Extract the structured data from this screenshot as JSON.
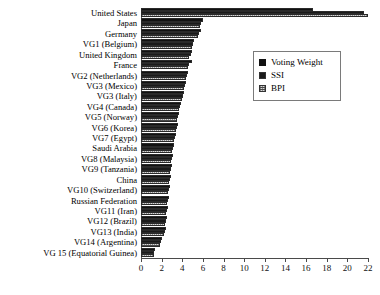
{
  "chart_data": {
    "type": "bar",
    "orientation": "horizontal",
    "title": "",
    "xlabel": "",
    "ylabel": "",
    "xlim": [
      0,
      22
    ],
    "xticks": [
      0,
      2,
      4,
      6,
      8,
      10,
      12,
      14,
      16,
      18,
      20,
      22
    ],
    "grid": false,
    "legend_position": "upper-right",
    "categories": [
      "United States",
      "Japan",
      "Germany",
      "VG1 (Belgium)",
      "United Kingdom",
      "France",
      "VG2 (Netherlands)",
      "VG3 (Mexico)",
      "VG3 (Italy)",
      "VG4 (Canada)",
      "VG5 (Norway)",
      "VG6 (Korea)",
      "VG7 (Egypt)",
      "Saudi Arabia",
      "VG8 (Malaysia)",
      "VG9 (Tanzania)",
      "China",
      "VG10 (Switzerland)",
      "Russian Federation",
      "VG11 (Iran)",
      "VG12 (Brazil)",
      "VG13 (India)",
      "VG14 (Argentina)",
      "VG 15 (Equatorial Guinea)"
    ],
    "series": [
      {
        "name": "Voting Weight",
        "pattern": "solid-black",
        "color": "#111111",
        "values": [
          16.7,
          6.0,
          5.8,
          5.1,
          4.9,
          4.9,
          4.6,
          4.4,
          4.2,
          3.9,
          3.7,
          3.6,
          3.4,
          3.2,
          3.1,
          3.0,
          2.9,
          2.8,
          2.7,
          2.6,
          2.5,
          2.4,
          2.0,
          1.4
        ]
      },
      {
        "name": "SSI",
        "pattern": "cross-hatch",
        "color": "#9a9a9a",
        "values": [
          21.6,
          5.8,
          5.6,
          5.0,
          4.8,
          4.7,
          4.5,
          4.3,
          4.1,
          3.8,
          3.6,
          3.5,
          3.3,
          3.1,
          3.0,
          2.9,
          2.8,
          2.7,
          2.6,
          2.5,
          2.4,
          2.3,
          1.9,
          1.3
        ]
      },
      {
        "name": "BPI",
        "pattern": "dotted",
        "color": "#d8d8d8",
        "values": [
          22.0,
          5.7,
          5.5,
          4.9,
          4.7,
          4.6,
          4.4,
          4.2,
          4.0,
          3.7,
          3.5,
          3.4,
          3.2,
          3.0,
          2.9,
          2.8,
          2.7,
          2.6,
          2.5,
          2.4,
          2.3,
          2.2,
          1.8,
          1.3
        ]
      }
    ]
  },
  "legend": {
    "items": [
      {
        "label": "Voting Weight"
      },
      {
        "label": "SSI"
      },
      {
        "label": "BPI"
      }
    ]
  }
}
